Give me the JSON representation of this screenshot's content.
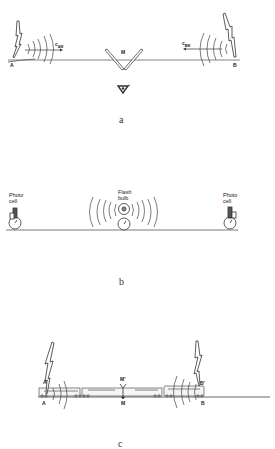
{
  "figure": {
    "panels": [
      {
        "id": "a",
        "caption": "a",
        "labels": {
          "point_a": "A",
          "point_b": "B",
          "mirror": "M",
          "speed_a": "c",
          "speed_a_sub": "AM",
          "speed_b": "c",
          "speed_b_sub": "BM"
        },
        "elements": [
          "lightning-bolt-A",
          "wavefronts-A",
          "arrow-c_AM",
          "v-mirror-M",
          "observer-eye",
          "wavefronts-B",
          "arrow-c_BM",
          "lightning-bolt-B",
          "ground-line"
        ]
      },
      {
        "id": "b",
        "caption": "b",
        "labels": {
          "left_device": "Photo\ncell",
          "left_device_l1": "Photo",
          "left_device_l2": "cell",
          "center_device_l1": "Flash",
          "center_device_l2": "bulb",
          "right_device_l1": "Photo",
          "right_device_l2": "cell"
        },
        "elements": [
          "photo-cell-clock-left",
          "flash-bulb-clock",
          "wavefronts",
          "photo-cell-clock-right",
          "ground-line"
        ]
      },
      {
        "id": "c",
        "caption": "c",
        "labels": {
          "train_a": "A'",
          "track_a": "A",
          "train_m": "M'",
          "track_m": "M",
          "train_b": "B'",
          "track_b": "B"
        },
        "elements": [
          "lightning-bolt-A",
          "lightning-bolt-B",
          "train",
          "wavefronts-A",
          "wavefronts-B",
          "track-line"
        ]
      }
    ]
  }
}
